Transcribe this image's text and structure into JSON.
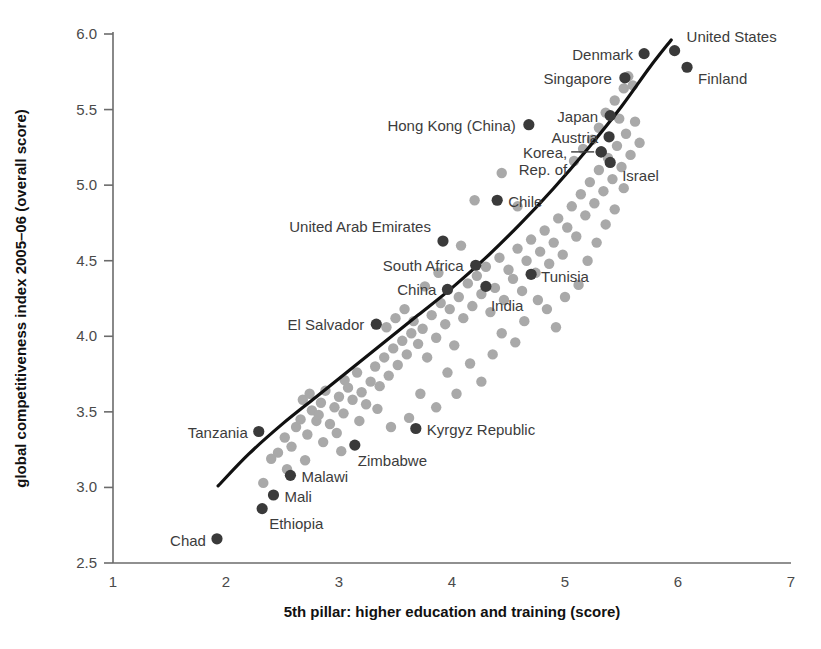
{
  "chart_data": {
    "type": "scatter",
    "title": "",
    "xlabel": "5th pillar: higher education and training (score)",
    "ylabel": "global competitiveness index 2005–06 (overall score)",
    "xlim": [
      1,
      7
    ],
    "ylim": [
      2.5,
      6.0
    ],
    "xticks": [
      "1",
      "2",
      "3",
      "4",
      "5",
      "6",
      "7"
    ],
    "yticks": [
      "2.5",
      "3.0",
      "3.5",
      "4.0",
      "4.5",
      "5.0",
      "5.5",
      "6.0"
    ],
    "grid": false,
    "legend": "none",
    "colors": {
      "highlight_point": "#3a3a3a",
      "background_point": "#a9a9a9",
      "trendline": "#111111",
      "axis": "#6b6b6b",
      "label_text": "#3c3c3c"
    },
    "labeled_points": [
      {
        "name": "United States",
        "x": 5.97,
        "y": 5.89,
        "label_dx": 12,
        "label_dy": -14,
        "anchor": "start"
      },
      {
        "name": "Denmark",
        "x": 5.7,
        "y": 5.87,
        "label_dx": -11,
        "label_dy": 1,
        "anchor": "end"
      },
      {
        "name": "Finland",
        "x": 6.08,
        "y": 5.78,
        "label_dx": 11,
        "label_dy": 12,
        "anchor": "start"
      },
      {
        "name": "Singapore",
        "x": 5.53,
        "y": 5.71,
        "label_dx": -13,
        "label_dy": 1,
        "anchor": "end"
      },
      {
        "name": "Japan",
        "x": 5.4,
        "y": 5.46,
        "label_dx": -12,
        "label_dy": 1,
        "anchor": "end"
      },
      {
        "name": "Hong Kong (China)",
        "x": 4.68,
        "y": 5.4,
        "label_dx": -13,
        "label_dy": 1,
        "anchor": "end"
      },
      {
        "name": "Austria",
        "x": 5.39,
        "y": 5.32,
        "label_dx": -11,
        "label_dy": 1,
        "anchor": "end"
      },
      {
        "name": "Korea,",
        "x": 5.32,
        "y": 5.22,
        "label_dx": -34,
        "label_dy": 1,
        "anchor": "end"
      },
      {
        "name": "Rep. of",
        "x": 5.32,
        "y": 5.22,
        "label_dx": -34,
        "label_dy": 18,
        "anchor": "end"
      },
      {
        "name": "Israel",
        "x": 5.4,
        "y": 5.15,
        "label_dx": 12,
        "label_dy": 14,
        "anchor": "start"
      },
      {
        "name": "Chile",
        "x": 4.4,
        "y": 4.9,
        "label_dx": 11,
        "label_dy": 2,
        "anchor": "start"
      },
      {
        "name": "United Arab Emirates",
        "x": 3.92,
        "y": 4.63,
        "label_dx": -12,
        "label_dy": -14,
        "anchor": "end"
      },
      {
        "name": "South Africa",
        "x": 4.21,
        "y": 4.47,
        "label_dx": -12,
        "label_dy": 1,
        "anchor": "end"
      },
      {
        "name": "Tunisia",
        "x": 4.7,
        "y": 4.41,
        "label_dx": 10,
        "label_dy": 3,
        "anchor": "start"
      },
      {
        "name": "China",
        "x": 3.96,
        "y": 4.31,
        "label_dx": -11,
        "label_dy": 1,
        "anchor": "end"
      },
      {
        "name": "India",
        "x": 4.3,
        "y": 4.33,
        "label_dx": 5,
        "label_dy": 20,
        "anchor": "start"
      },
      {
        "name": "El Salvador",
        "x": 3.33,
        "y": 4.08,
        "label_dx": -12,
        "label_dy": 1,
        "anchor": "end"
      },
      {
        "name": "Kyrgyz Republic",
        "x": 3.68,
        "y": 3.39,
        "label_dx": 11,
        "label_dy": 2,
        "anchor": "start"
      },
      {
        "name": "Tanzania",
        "x": 2.29,
        "y": 3.37,
        "label_dx": -11,
        "label_dy": 1,
        "anchor": "end"
      },
      {
        "name": "Zimbabwe",
        "x": 3.14,
        "y": 3.28,
        "label_dx": 3,
        "label_dy": 16,
        "anchor": "start"
      },
      {
        "name": "Malawi",
        "x": 2.57,
        "y": 3.08,
        "label_dx": 11,
        "label_dy": 2,
        "anchor": "start"
      },
      {
        "name": "Mali",
        "x": 2.42,
        "y": 2.95,
        "label_dx": 11,
        "label_dy": 2,
        "anchor": "start"
      },
      {
        "name": "Ethiopia",
        "x": 2.32,
        "y": 2.86,
        "label_dx": 7,
        "label_dy": 15,
        "anchor": "start"
      },
      {
        "name": "Chad",
        "x": 1.92,
        "y": 2.66,
        "label_dx": -11,
        "label_dy": 2,
        "anchor": "end"
      }
    ],
    "background_points": [
      [
        2.33,
        3.03
      ],
      [
        2.4,
        3.19
      ],
      [
        2.46,
        3.23
      ],
      [
        2.52,
        3.33
      ],
      [
        2.58,
        3.27
      ],
      [
        2.62,
        3.4
      ],
      [
        2.66,
        3.45
      ],
      [
        2.72,
        3.35
      ],
      [
        2.76,
        3.51
      ],
      [
        2.8,
        3.44
      ],
      [
        2.68,
        3.58
      ],
      [
        2.74,
        3.62
      ],
      [
        2.84,
        3.56
      ],
      [
        2.88,
        3.64
      ],
      [
        2.82,
        3.48
      ],
      [
        2.92,
        3.42
      ],
      [
        2.96,
        3.53
      ],
      [
        3.0,
        3.6
      ],
      [
        3.04,
        3.49
      ],
      [
        3.08,
        3.66
      ],
      [
        3.12,
        3.58
      ],
      [
        3.05,
        3.71
      ],
      [
        3.16,
        3.76
      ],
      [
        3.2,
        3.63
      ],
      [
        3.24,
        3.55
      ],
      [
        3.28,
        3.7
      ],
      [
        3.32,
        3.8
      ],
      [
        3.36,
        3.67
      ],
      [
        3.4,
        3.86
      ],
      [
        3.44,
        3.74
      ],
      [
        3.48,
        3.92
      ],
      [
        3.52,
        3.81
      ],
      [
        3.56,
        3.97
      ],
      [
        3.6,
        3.88
      ],
      [
        3.64,
        4.02
      ],
      [
        3.42,
        4.06
      ],
      [
        3.5,
        4.12
      ],
      [
        3.58,
        4.18
      ],
      [
        3.66,
        4.1
      ],
      [
        3.7,
        3.95
      ],
      [
        3.74,
        4.05
      ],
      [
        3.78,
        3.86
      ],
      [
        3.82,
        4.14
      ],
      [
        3.86,
        3.99
      ],
      [
        3.9,
        4.22
      ],
      [
        3.94,
        4.08
      ],
      [
        3.98,
        4.18
      ],
      [
        4.02,
        3.94
      ],
      [
        4.06,
        4.26
      ],
      [
        4.1,
        4.12
      ],
      [
        4.14,
        4.35
      ],
      [
        4.18,
        4.2
      ],
      [
        4.22,
        4.4
      ],
      [
        4.26,
        4.28
      ],
      [
        4.3,
        4.46
      ],
      [
        4.34,
        4.16
      ],
      [
        4.38,
        4.32
      ],
      [
        4.42,
        4.52
      ],
      [
        4.46,
        4.24
      ],
      [
        4.5,
        4.44
      ],
      [
        4.54,
        4.38
      ],
      [
        4.58,
        4.58
      ],
      [
        4.62,
        4.3
      ],
      [
        4.66,
        4.5
      ],
      [
        4.7,
        4.64
      ],
      [
        4.74,
        4.42
      ],
      [
        4.78,
        4.56
      ],
      [
        4.82,
        4.7
      ],
      [
        4.86,
        4.48
      ],
      [
        4.9,
        4.62
      ],
      [
        4.94,
        4.78
      ],
      [
        4.98,
        4.54
      ],
      [
        5.02,
        4.72
      ],
      [
        5.06,
        4.86
      ],
      [
        5.1,
        4.66
      ],
      [
        5.14,
        4.94
      ],
      [
        5.18,
        4.8
      ],
      [
        5.22,
        5.02
      ],
      [
        5.26,
        4.88
      ],
      [
        5.3,
        5.1
      ],
      [
        5.34,
        4.96
      ],
      [
        5.38,
        5.18
      ],
      [
        5.42,
        5.04
      ],
      [
        5.46,
        5.26
      ],
      [
        5.5,
        5.12
      ],
      [
        5.54,
        5.34
      ],
      [
        5.58,
        5.2
      ],
      [
        5.62,
        5.42
      ],
      [
        5.66,
        5.28
      ],
      [
        5.3,
        5.38
      ],
      [
        5.36,
        5.48
      ],
      [
        5.44,
        5.56
      ],
      [
        5.52,
        5.64
      ],
      [
        5.56,
        5.72
      ],
      [
        5.6,
        5.66
      ],
      [
        5.48,
        5.44
      ],
      [
        5.24,
        5.3
      ],
      [
        5.16,
        5.24
      ],
      [
        5.08,
        5.16
      ],
      [
        4.44,
        5.08
      ],
      [
        4.2,
        4.9
      ],
      [
        4.58,
        4.86
      ],
      [
        3.76,
        4.33
      ],
      [
        3.88,
        4.42
      ],
      [
        4.08,
        4.6
      ],
      [
        2.98,
        3.36
      ],
      [
        3.18,
        3.44
      ],
      [
        3.34,
        3.52
      ],
      [
        3.46,
        3.4
      ],
      [
        3.62,
        3.46
      ],
      [
        3.86,
        3.53
      ],
      [
        4.04,
        3.62
      ],
      [
        4.26,
        3.7
      ],
      [
        3.72,
        3.62
      ],
      [
        3.96,
        3.76
      ],
      [
        4.16,
        3.82
      ],
      [
        4.36,
        3.88
      ],
      [
        4.56,
        3.96
      ],
      [
        4.44,
        4.02
      ],
      [
        4.64,
        4.1
      ],
      [
        4.84,
        4.18
      ],
      [
        5.0,
        4.26
      ],
      [
        4.92,
        4.06
      ],
      [
        5.12,
        4.34
      ],
      [
        4.76,
        4.24
      ],
      [
        5.2,
        4.5
      ],
      [
        5.28,
        4.62
      ],
      [
        5.36,
        4.74
      ],
      [
        5.44,
        4.84
      ],
      [
        5.52,
        4.98
      ],
      [
        2.54,
        3.12
      ],
      [
        2.7,
        3.18
      ],
      [
        2.86,
        3.3
      ],
      [
        3.02,
        3.24
      ]
    ],
    "trendline": [
      [
        1.93,
        3.01
      ],
      [
        2.2,
        3.22
      ],
      [
        2.5,
        3.42
      ],
      [
        2.8,
        3.6
      ],
      [
        3.1,
        3.78
      ],
      [
        3.4,
        3.96
      ],
      [
        3.7,
        4.14
      ],
      [
        4.0,
        4.32
      ],
      [
        4.3,
        4.52
      ],
      [
        4.6,
        4.74
      ],
      [
        4.9,
        4.98
      ],
      [
        5.2,
        5.24
      ],
      [
        5.5,
        5.52
      ],
      [
        5.75,
        5.78
      ],
      [
        5.94,
        5.96
      ]
    ]
  }
}
